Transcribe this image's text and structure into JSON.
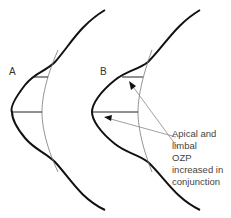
{
  "diagram": {
    "panels": [
      {
        "id": "A",
        "label": "A"
      },
      {
        "id": "B",
        "label": "B"
      }
    ],
    "annotation": {
      "lines": [
        "Apical and limbal",
        "OZP increased in",
        "conjunction"
      ]
    },
    "colors": {
      "profile": "#111111",
      "guide": "#777777",
      "arrow": "#888888",
      "text": "#444444"
    }
  }
}
